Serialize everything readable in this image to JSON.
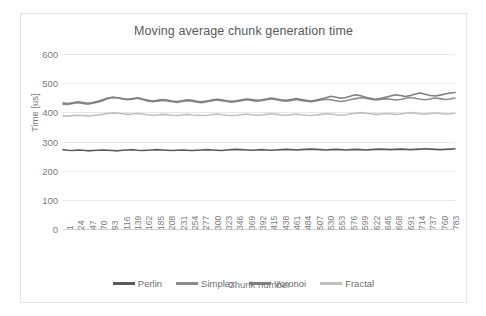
{
  "chart_data": {
    "type": "line",
    "title": "Moving average chunk generation time",
    "xlabel": "Chunk number",
    "ylabel": "Time [us]",
    "ylim": [
      0,
      600
    ],
    "yticks": [
      0,
      100,
      200,
      300,
      400,
      500,
      600
    ],
    "grid": true,
    "legend_position": "bottom",
    "xticks": [
      1,
      24,
      47,
      70,
      93,
      116,
      139,
      162,
      185,
      208,
      231,
      254,
      277,
      300,
      323,
      346,
      369,
      392,
      415,
      438,
      461,
      484,
      507,
      530,
      553,
      576,
      599,
      622,
      645,
      668,
      691,
      714,
      737,
      760,
      783
    ],
    "xlim": [
      1,
      800
    ],
    "series": [
      {
        "name": "Perlin",
        "color": "#595959",
        "values": [
          272,
          270,
          269,
          271,
          270,
          268,
          269,
          270,
          271,
          270,
          269,
          268,
          270,
          271,
          272,
          270,
          269,
          270,
          271,
          272,
          271,
          270,
          269,
          270,
          271,
          270,
          269,
          270,
          271,
          272,
          271,
          270,
          269,
          271,
          272,
          273,
          272,
          271,
          270,
          271,
          272,
          271,
          270,
          271,
          272,
          273,
          272,
          271,
          272,
          273,
          274,
          273,
          272,
          271,
          272,
          273,
          272,
          271,
          272,
          273,
          272,
          271,
          272,
          273,
          274,
          273,
          272,
          273,
          274,
          273,
          272,
          273,
          274,
          275,
          274,
          273,
          272,
          273,
          274,
          275
        ]
      },
      {
        "name": "Simplex",
        "color": "#8c8c8c",
        "values": [
          428,
          427,
          430,
          433,
          430,
          428,
          431,
          435,
          440,
          447,
          451,
          450,
          446,
          443,
          445,
          448,
          444,
          439,
          436,
          438,
          441,
          439,
          436,
          434,
          437,
          440,
          438,
          435,
          433,
          436,
          439,
          442,
          440,
          437,
          435,
          437,
          440,
          443,
          441,
          438,
          440,
          443,
          446,
          443,
          440,
          438,
          441,
          444,
          441,
          438,
          436,
          439,
          442,
          445,
          443,
          440,
          437,
          440,
          444,
          447,
          450,
          448,
          445,
          442,
          444,
          447,
          445,
          442,
          444,
          448,
          451,
          448,
          445,
          443,
          446,
          449,
          447,
          444,
          446,
          449
        ]
      },
      {
        "name": "Voronoi",
        "color": "#7f7f7f",
        "values": [
          432,
          430,
          433,
          436,
          434,
          431,
          434,
          438,
          443,
          449,
          452,
          450,
          447,
          445,
          447,
          450,
          446,
          442,
          439,
          441,
          444,
          442,
          439,
          437,
          440,
          443,
          441,
          438,
          436,
          439,
          442,
          445,
          443,
          440,
          438,
          440,
          443,
          446,
          444,
          441,
          443,
          446,
          449,
          446,
          443,
          441,
          444,
          447,
          444,
          441,
          439,
          442,
          446,
          450,
          455,
          452,
          448,
          451,
          456,
          460,
          457,
          452,
          448,
          445,
          448,
          452,
          456,
          460,
          458,
          454,
          458,
          463,
          466,
          462,
          458,
          456,
          459,
          463,
          466,
          468
        ]
      },
      {
        "name": "Fractal",
        "color": "#bfbfbf",
        "values": [
          388,
          387,
          389,
          390,
          389,
          388,
          389,
          391,
          393,
          396,
          398,
          397,
          395,
          393,
          394,
          396,
          394,
          392,
          390,
          391,
          393,
          392,
          390,
          389,
          391,
          393,
          391,
          390,
          389,
          390,
          392,
          394,
          392,
          390,
          389,
          390,
          392,
          394,
          392,
          390,
          391,
          393,
          395,
          393,
          391,
          390,
          392,
          394,
          392,
          390,
          389,
          391,
          393,
          395,
          394,
          392,
          390,
          392,
          395,
          397,
          399,
          397,
          395,
          393,
          394,
          396,
          395,
          393,
          394,
          397,
          399,
          397,
          395,
          394,
          396,
          398,
          396,
          394,
          395,
          397
        ]
      }
    ]
  }
}
